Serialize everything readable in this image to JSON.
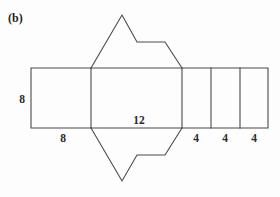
{
  "figure": {
    "part_label": "(b)",
    "background_color": "#fdfdfd",
    "line_color": "#4a4a4a",
    "text_color": "#2b2b2b",
    "dimension_labels": [
      {
        "name": "height-left",
        "value": "8",
        "x": 22,
        "y": 103,
        "orientation": "vertical-side"
      },
      {
        "name": "width-left-rect",
        "value": "8",
        "x": 63,
        "y": 142,
        "orientation": "bottom"
      },
      {
        "name": "width-center-rect",
        "value": "12",
        "x": 139,
        "y": 124,
        "orientation": "inside-bottom"
      },
      {
        "name": "width-rect-3",
        "value": "4",
        "x": 196,
        "y": 142,
        "orientation": "bottom"
      },
      {
        "name": "width-rect-4",
        "value": "4",
        "x": 225,
        "y": 142,
        "orientation": "bottom"
      },
      {
        "name": "width-rect-5",
        "value": "4",
        "x": 254,
        "y": 142,
        "orientation": "bottom"
      }
    ],
    "strip": {
      "top_y": 68,
      "bottom_y": 128,
      "left_x": 31,
      "right_x": 268,
      "divider_x": [
        91,
        182,
        211,
        240
      ]
    },
    "top_flap_path": "M 91 68 L 122 15 L 137 42 L 165 42 L 182 68",
    "bottom_flap_path": "M 91 128 L 122 181 L 137 155 L 165 155 L 182 128",
    "strip_outline_path": "M 31 68 L 268 68 L 268 128 L 31 128 Z",
    "divider_paths": [
      "M 91 68 L 91 128",
      "M 182 68 L 182 128",
      "M 211 68 L 211 128",
      "M 240 68 L 240 128"
    ]
  }
}
